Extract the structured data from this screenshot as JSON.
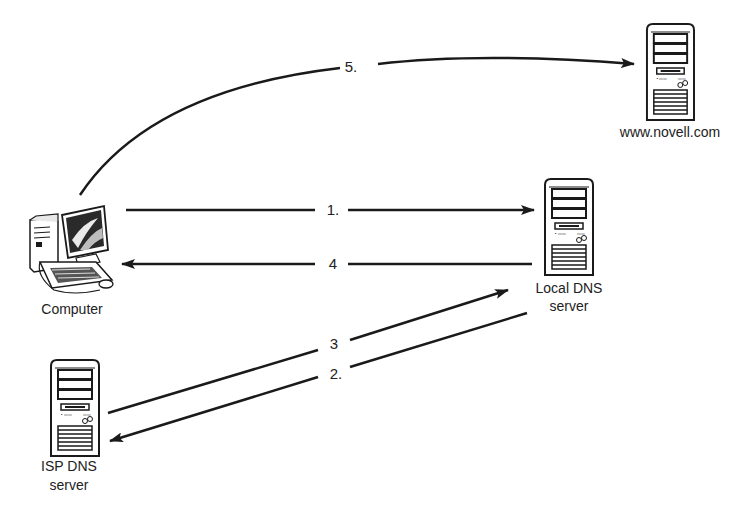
{
  "diagram": {
    "nodes": [
      {
        "id": "computer",
        "label_lines": [
          "Computer"
        ],
        "icon": "desktop-computer-icon"
      },
      {
        "id": "local_dns",
        "label_lines": [
          "Local DNS",
          "server"
        ],
        "icon": "server-tower-icon"
      },
      {
        "id": "isp_dns",
        "label_lines": [
          "ISP DNS",
          "server"
        ],
        "icon": "server-tower-icon"
      },
      {
        "id": "web_server",
        "label_lines": [
          "www.novell.com"
        ],
        "icon": "server-tower-icon"
      }
    ],
    "edges": [
      {
        "label": "1.",
        "from": "computer",
        "to": "local_dns"
      },
      {
        "label": "2.",
        "from": "local_dns",
        "to": "isp_dns"
      },
      {
        "label": "3",
        "from": "isp_dns",
        "to": "local_dns"
      },
      {
        "label": "4",
        "from": "local_dns",
        "to": "computer"
      },
      {
        "label": "5.",
        "from": "computer",
        "to": "web_server"
      }
    ]
  },
  "colors": {
    "line": "#1a1a1a",
    "text": "#222222",
    "background": "#ffffff"
  }
}
